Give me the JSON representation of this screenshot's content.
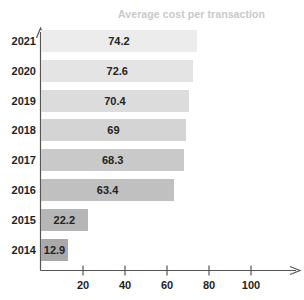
{
  "chart_data": {
    "type": "bar",
    "orientation": "horizontal",
    "title": "Average cost per transaction",
    "xlabel": "",
    "ylabel": "",
    "categories": [
      "2021",
      "2020",
      "2019",
      "2018",
      "2017",
      "2016",
      "2015",
      "2014"
    ],
    "values": [
      74.2,
      72.6,
      70.4,
      69,
      68.3,
      63.4,
      22.2,
      12.9
    ],
    "value_labels": [
      "74.2",
      "72.6",
      "70.4",
      "69",
      "68.3",
      "63.4",
      "22.2",
      "12.9"
    ],
    "bar_colors": [
      "#ececec",
      "#e4e4e4",
      "#dcdcdc",
      "#d4d4d4",
      "#c9c9c9",
      "#c0c0c0",
      "#b6b6b6",
      "#a9a9a9"
    ],
    "xlim": [
      0,
      110
    ],
    "xticks": [
      20,
      40,
      60,
      80,
      100
    ],
    "xtick_labels": [
      "20",
      "40",
      "60",
      "80",
      "100"
    ],
    "grid": false,
    "legend": false,
    "axis_color": "#555555",
    "title_color": "#c9c9c9",
    "label_color": "#1f1f1f"
  }
}
